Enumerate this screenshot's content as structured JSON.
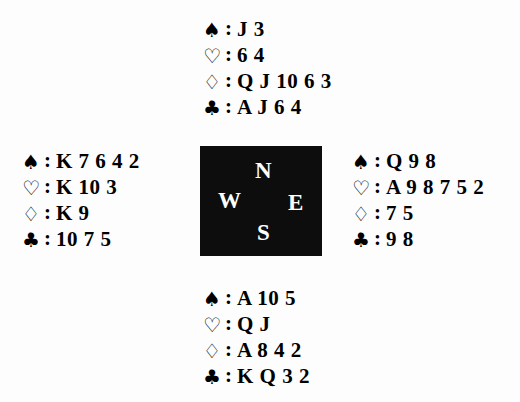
{
  "diagram": {
    "type": "bridge-hand-diagram",
    "background_color": "#fdfdfd",
    "text_color": "#000000"
  },
  "compass": {
    "box_color": "#0d0d0d",
    "letter_color": "#ffffff",
    "north": "N",
    "west": "W",
    "east": "E",
    "south": "S"
  },
  "suits": {
    "spade": {
      "symbol": "♠",
      "name": "spade-symbol"
    },
    "heart": {
      "symbol": "♡",
      "name": "heart-symbol"
    },
    "diamond": {
      "symbol": "♢",
      "name": "diamond-symbol"
    },
    "club": {
      "symbol": "♣",
      "name": "club-symbol"
    },
    "separator": ":"
  },
  "hands": {
    "north": {
      "position": "North",
      "spades": "J 3",
      "hearts": "6 4",
      "diamonds": "Q J 10 6 3",
      "clubs": "A J 6 4"
    },
    "west": {
      "position": "West",
      "spades": "K 7 6 4 2",
      "hearts": "K 10 3",
      "diamonds": "K 9",
      "clubs": "10 7 5"
    },
    "east": {
      "position": "East",
      "spades": "Q 9 8",
      "hearts": "A 9 8 7 5 2",
      "diamonds": "7 5",
      "clubs": "9 8"
    },
    "south": {
      "position": "South",
      "spades": "A 10 5",
      "hearts": "Q J",
      "diamonds": "A 8 4 2",
      "clubs": "K Q 3 2"
    }
  }
}
